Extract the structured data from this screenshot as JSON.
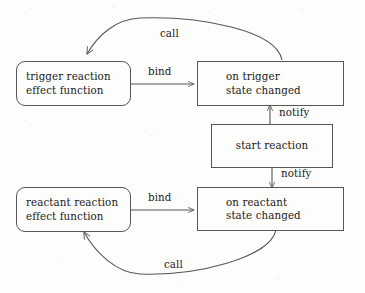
{
  "diagram": {
    "stroke_color": "#55555a",
    "text_color": "#1a1a1a",
    "background_color": "#fdfdfc",
    "nodes": [
      {
        "id": "trigger-effect",
        "shape": "rounded-rectangle",
        "line1": "trigger reaction",
        "line2": "effect function"
      },
      {
        "id": "on-trigger",
        "shape": "rectangle",
        "line1": "on trigger",
        "line2": "state changed"
      },
      {
        "id": "start-reaction",
        "shape": "rectangle",
        "line1": "start reaction",
        "line2": ""
      },
      {
        "id": "reactant-effect",
        "shape": "rounded-rectangle",
        "line1": "reactant reaction",
        "line2": "effect function"
      },
      {
        "id": "on-reactant",
        "shape": "rectangle",
        "line1": "on reactant",
        "line2": "state changed"
      }
    ],
    "edges": [
      {
        "id": "call-top",
        "label": "call",
        "from": "on-trigger",
        "to": "trigger-effect",
        "style": "curved"
      },
      {
        "id": "bind-top",
        "label": "bind",
        "from": "trigger-effect",
        "to": "on-trigger",
        "style": "straight"
      },
      {
        "id": "notify-up",
        "label": "notify",
        "from": "start-reaction",
        "to": "on-trigger",
        "style": "straight"
      },
      {
        "id": "notify-down",
        "label": "notify",
        "from": "start-reaction",
        "to": "on-reactant",
        "style": "straight"
      },
      {
        "id": "bind-bottom",
        "label": "bind",
        "from": "reactant-effect",
        "to": "on-reactant",
        "style": "straight"
      },
      {
        "id": "call-bottom",
        "label": "call",
        "from": "on-reactant",
        "to": "reactant-effect",
        "style": "curved"
      }
    ]
  }
}
